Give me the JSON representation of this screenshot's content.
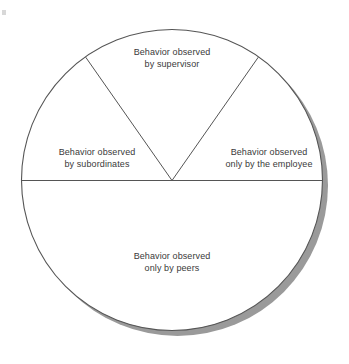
{
  "figure": {
    "kind": "pie-diagram",
    "background_color": "#ffffff",
    "outline_color": "#555555",
    "fill_color": "#ffffff",
    "shadow_color": "#9a9a9a",
    "text_color": "#3a3a3a"
  },
  "geometry": {
    "center_x": 172,
    "center_y": 180,
    "radius": 151,
    "shadow_offset_x": 5,
    "shadow_offset_y": 5,
    "divider_angles_deg": [
      55,
      125,
      180,
      360
    ],
    "horizontal_divider_y": 181
  },
  "segments": [
    {
      "id": "supervisor",
      "position": "top",
      "line1": "Behavior observed",
      "line2": "by supervisor"
    },
    {
      "id": "subordinates",
      "position": "left",
      "line1": "Behavior observed",
      "line2": "by subordinates"
    },
    {
      "id": "employee",
      "position": "right",
      "line1": "Behavior observed",
      "line2": "only by the employee"
    },
    {
      "id": "peers",
      "position": "bottom",
      "line1": "Behavior observed",
      "line2": "only by peers"
    }
  ]
}
